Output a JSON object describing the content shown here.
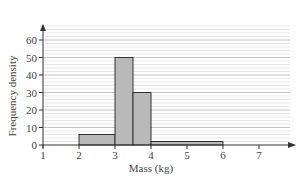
{
  "chart_data": {
    "type": "bar",
    "subtype": "histogram",
    "title": "",
    "xlabel": "Mass (kg)",
    "ylabel": "Frequency density",
    "xlim": [
      1,
      7.6
    ],
    "ylim": [
      0,
      68
    ],
    "x_ticks": [
      1,
      2,
      3,
      4,
      5,
      6,
      7
    ],
    "y_ticks": [
      0,
      10,
      20,
      30,
      40,
      50,
      60
    ],
    "grid": true,
    "minor_grid_step": 2,
    "legend": null,
    "bins": [
      {
        "x_start": 2,
        "x_end": 3,
        "frequency_density": 6
      },
      {
        "x_start": 3,
        "x_end": 3.5,
        "frequency_density": 50
      },
      {
        "x_start": 3.5,
        "x_end": 4,
        "frequency_density": 30
      },
      {
        "x_start": 4,
        "x_end": 6,
        "frequency_density": 2
      }
    ],
    "categories": [
      "2-3",
      "3-3.5",
      "3.5-4",
      "4-6"
    ],
    "values": [
      6,
      50,
      30,
      2
    ]
  },
  "style": {
    "bar_fill": "#b9b9b9",
    "bar_stroke": "#333333",
    "grid_color": "#d8d8d8",
    "axis_color": "#333333"
  }
}
